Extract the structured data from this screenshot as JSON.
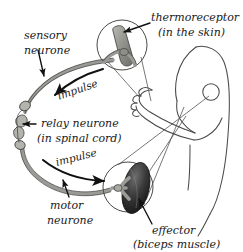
{
  "diagram": {
    "background_color": "#ffffff",
    "ink_color": "#1a1a1a",
    "nerve_color": "#9a9a96",
    "muscle_color": "#2e2e2e",
    "receptor_color": "#8f8f8a"
  },
  "labels": {
    "sensory_neurone_line1": "sensory",
    "sensory_neurone_line2": "neurone",
    "relay_neurone_line1": "relay neurone",
    "relay_neurone_line2": "(in spinal cord)",
    "motor_neurone_line1": "motor",
    "motor_neurone_line2": "neurone",
    "thermoreceptor_line1": "thermoreceptor",
    "thermoreceptor_line2": "(in the skin)",
    "effector_line1": "effector",
    "effector_line2": "(biceps muscle)",
    "impulse_upper": "impulse",
    "impulse_lower": "impulse"
  },
  "parts": [
    {
      "name": "sensory-neurone",
      "label": "sensory neurone"
    },
    {
      "name": "relay-neurone",
      "label": "relay neurone (in spinal cord)"
    },
    {
      "name": "motor-neurone",
      "label": "motor neurone"
    },
    {
      "name": "thermoreceptor",
      "label": "thermoreceptor (in the skin)"
    },
    {
      "name": "effector",
      "label": "effector (biceps muscle)"
    }
  ]
}
